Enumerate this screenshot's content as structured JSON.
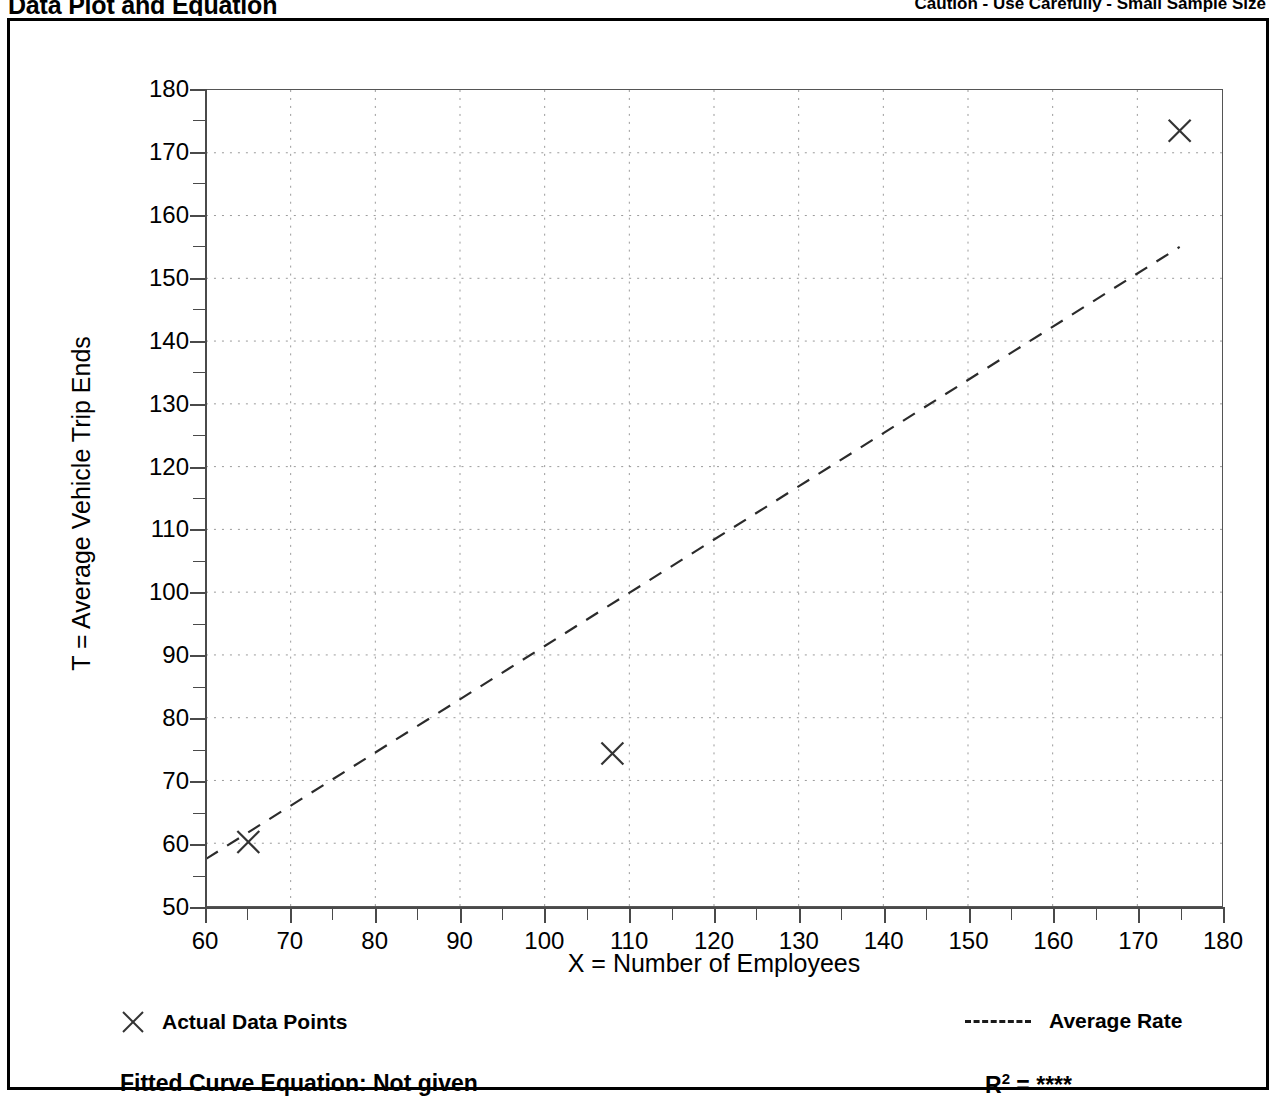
{
  "header": {
    "title": "Data Plot and Equation",
    "caution": "Caution - Use Carefully - Small Sample Size"
  },
  "legend": {
    "data_points_label": "Actual Data Points",
    "average_rate_label": "Average Rate",
    "marker_icon": "x-marker-icon",
    "line_icon": "dashed-line-icon"
  },
  "footer": {
    "equation_label": "Fitted Curve Equation:  Not given",
    "r2_label": "R",
    "r2_sup": "2",
    "r2_value": "= ****"
  },
  "chart_data": {
    "type": "scatter",
    "title": "Data Plot and Equation",
    "subtitle": "Caution - Use Carefully - Small Sample Size",
    "xlabel": "X = Number of Employees",
    "ylabel": "T = Average Vehicle Trip Ends",
    "xlim": [
      60,
      180
    ],
    "ylim": [
      50,
      180
    ],
    "xticks": [
      60,
      70,
      80,
      90,
      100,
      110,
      120,
      130,
      140,
      150,
      160,
      170,
      180
    ],
    "yticks": [
      50,
      60,
      70,
      80,
      90,
      100,
      110,
      120,
      130,
      140,
      150,
      160,
      170,
      180
    ],
    "x_minor_step": 5,
    "y_minor_step": 5,
    "grid": true,
    "grid_style": "dotted",
    "legend_position": "below-plot",
    "series": [
      {
        "name": "Actual Data Points",
        "type": "scatter",
        "marker": "x",
        "points": [
          {
            "x": 65,
            "y": 60.2
          },
          {
            "x": 108,
            "y": 74.3
          },
          {
            "x": 175,
            "y": 173.5
          }
        ]
      },
      {
        "name": "Average Rate",
        "type": "line",
        "style": "dashed",
        "points": [
          {
            "x": 60,
            "y": 57.5
          },
          {
            "x": 175,
            "y": 155.0
          }
        ]
      }
    ],
    "annotations": {
      "fitted_curve_equation": "Not given",
      "r_squared": "****"
    }
  }
}
